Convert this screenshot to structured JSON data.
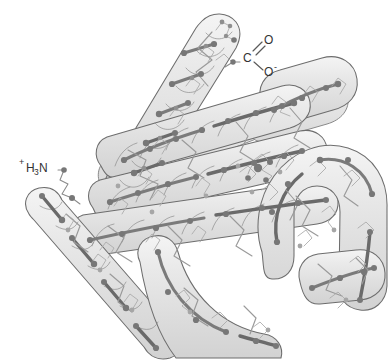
{
  "figure": {
    "background_color": "#ffffff",
    "tube_fill_color": "#e6e6e6",
    "tube_outline_color": "#6d6d6d",
    "backbone_color": "#7b7b7b",
    "atom_node_color": "#777777",
    "label_color": "#333333"
  },
  "labels": {
    "n_terminus": {
      "name": "amino-terminus",
      "charge": "+",
      "element_h": "H",
      "subscript_3": "3",
      "element_n": "N"
    },
    "c_terminus": {
      "name": "carboxyl-terminus",
      "carbon": "C",
      "oxygen_double": "O",
      "oxygen_single": "O",
      "charge": "-"
    }
  },
  "structure": {
    "helix_count": 8,
    "terminus_labels": [
      "+H3N",
      "COO-"
    ],
    "render_style": "translucent-tube"
  }
}
